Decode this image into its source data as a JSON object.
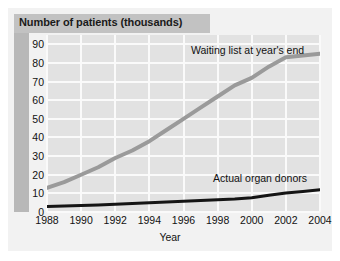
{
  "chart_data": {
    "type": "line",
    "title": "Number of patients (thousands)",
    "xlabel": "Year",
    "ylabel": "Number of patients (thousands)",
    "x": [
      1988,
      1989,
      1990,
      1991,
      1992,
      1993,
      1994,
      1995,
      1996,
      1997,
      1998,
      1999,
      2000,
      2001,
      2002,
      2003,
      2004
    ],
    "xlim": [
      1988,
      2004
    ],
    "ylim": [
      0,
      95
    ],
    "xticks": [
      "1988",
      "1990",
      "1992",
      "1994",
      "1996",
      "1998",
      "2000",
      "2002",
      "2004"
    ],
    "xtick_values": [
      1988,
      1990,
      1992,
      1994,
      1996,
      1998,
      2000,
      2002,
      2004
    ],
    "yticks": [
      "0",
      "10",
      "20",
      "30",
      "40",
      "50",
      "60",
      "70",
      "80",
      "90"
    ],
    "ytick_values": [
      0,
      10,
      20,
      30,
      40,
      50,
      60,
      70,
      80,
      90
    ],
    "grid": true,
    "legend_position": "inline-labels",
    "series": [
      {
        "name": "Waiting list at year's end",
        "color": "#9a9a9a",
        "values": [
          13,
          16,
          20,
          24,
          29,
          33,
          38,
          44,
          50,
          56,
          62,
          68,
          72,
          78,
          83,
          84,
          85
        ]
      },
      {
        "name": "Actual organ donors",
        "color": "#151515",
        "values": [
          3,
          3.2,
          3.5,
          3.8,
          4.2,
          4.6,
          5,
          5.4,
          5.8,
          6.2,
          6.6,
          7,
          7.6,
          9,
          10.2,
          11,
          12
        ]
      }
    ],
    "annotations": [
      {
        "text": "Waiting list at year's end",
        "series": "Waiting list at year's end"
      },
      {
        "text": "Actual organ donors",
        "series": "Actual organ donors"
      }
    ],
    "colors": {
      "plot_background": "#e2e2e2",
      "gridline": "#fafafa",
      "title_band": "#c2c2c2",
      "left_band": "#b8b8b8",
      "card_background": "#f2f2f2",
      "page_background": "#ffffff",
      "text": "#111111"
    }
  }
}
